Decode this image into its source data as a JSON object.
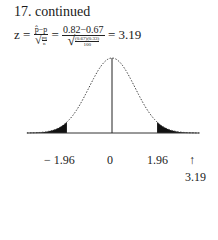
{
  "problem": {
    "title": "17.  continued",
    "formula": {
      "lhs": "z",
      "eq1": "=",
      "sym_num": "p̂−p",
      "sym_den_inner": "pq",
      "sym_den_n": "n",
      "eq2": "=",
      "val_num": "0.82−0.67",
      "val_den_top": "(0.67)(0.33)",
      "val_den_bottom": "100",
      "eq3": "=",
      "result": "3.19"
    }
  },
  "figure": {
    "type": "normal-curve",
    "shaded_tails": [
      "left",
      "right"
    ],
    "axis_labels": {
      "left_critical": "− 1.96",
      "center": "0",
      "right_critical": "1.96",
      "arrow": "↑",
      "test_statistic": "3.19"
    },
    "critical_value": 1.96,
    "test_statistic_value": 3.19
  }
}
